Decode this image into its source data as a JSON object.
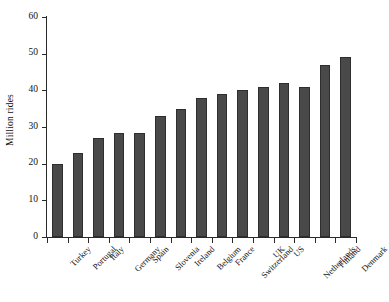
{
  "chart_data": {
    "type": "bar",
    "title": "",
    "subtitle": "",
    "xlabel": "",
    "ylabel": "Million rides",
    "ylim": [
      0,
      60
    ],
    "yticks": [
      0,
      10,
      20,
      30,
      40,
      50,
      60
    ],
    "ytick_labels": [
      "0",
      "10",
      "20",
      "30",
      "40",
      "50",
      "60"
    ],
    "grid": false,
    "legend": null,
    "categories": [
      "Turkey",
      "Portugal",
      "Italy",
      "Germany",
      "Spain",
      "Slovenia",
      "Ireland",
      "Belgium",
      "France",
      "Switzerland",
      "UK",
      "US",
      "Netherlands",
      "Finland",
      "Denmark"
    ],
    "values": [
      20,
      23,
      27,
      28.5,
      28.5,
      33,
      35,
      38,
      39,
      40,
      41,
      42,
      41,
      47,
      49
    ],
    "series": [
      {
        "name": "Million rides",
        "values": [
          20,
          23,
          27,
          28.5,
          28.5,
          33,
          35,
          38,
          39,
          40,
          41,
          42,
          41,
          47,
          49
        ]
      }
    ],
    "bar_color": "#494949",
    "bar_edge_color": "#2e2e2e",
    "axis_color": "#2a2a2a",
    "background_color": "#ffffff"
  }
}
